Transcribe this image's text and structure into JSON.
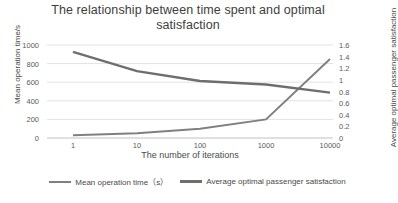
{
  "chart_data": {
    "type": "line",
    "title": "The relationship between time spent and optimal satisfaction",
    "xlabel": "The number of iterations",
    "ylabel": "Mean operation time/s",
    "y2label": "Average optimal passenger satisfaction",
    "categories": [
      "1",
      "10",
      "100",
      "1000",
      "10000"
    ],
    "x_tick_labels": [
      "1",
      "10",
      "100",
      "1000",
      "10000"
    ],
    "y_tick_labels": [
      "0",
      "200",
      "400",
      "600",
      "800",
      "1000"
    ],
    "y2_tick_labels": [
      "0",
      "0.2",
      "0.4",
      "0.6",
      "0.8",
      "1",
      "1.2",
      "1.4",
      "1.6"
    ],
    "ylim": [
      0,
      1000
    ],
    "y2lim": [
      0,
      1.6
    ],
    "grid": true,
    "legend_position": "bottom",
    "series": [
      {
        "name": "Mean operation time（s）",
        "axis": "left",
        "color": "#808080",
        "values": [
          30,
          50,
          100,
          200,
          850
        ]
      },
      {
        "name": "Average optimal passenger satisfaction",
        "axis": "right",
        "color": "#6e6e6e",
        "values": [
          1.48,
          1.15,
          0.98,
          0.92,
          0.78
        ]
      }
    ]
  },
  "legend": {
    "items": [
      {
        "label": "Mean operation time（s）"
      },
      {
        "label": "Average optimal passenger satisfaction"
      }
    ]
  }
}
